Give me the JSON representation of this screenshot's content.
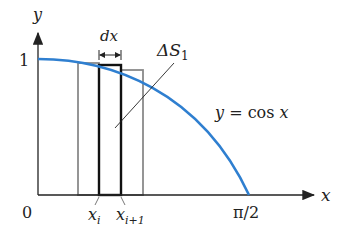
{
  "diagram": {
    "axis_labels": {
      "x": "x",
      "y": "y"
    },
    "ticks": {
      "origin": "0",
      "y_one": "1",
      "x_end": "π/2"
    },
    "strip_labels": {
      "left": "x",
      "left_sub": "i",
      "right": "x",
      "right_sub": "i+1"
    },
    "width_label": "dx",
    "area_label": {
      "main": "ΔS",
      "sub": "1"
    },
    "curve_label": {
      "lhs": "y",
      "eq": " = ",
      "fn": "cos ",
      "var": "x"
    },
    "colors": {
      "curve": "#2f7fd0",
      "axis": "#222222",
      "strip": "#111111",
      "neighbor": "#8a8a8a"
    }
  }
}
